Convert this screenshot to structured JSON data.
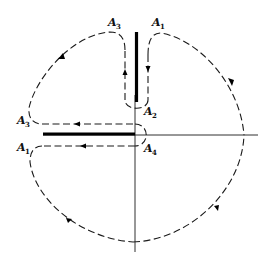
{
  "diagram": {
    "type": "complex-plane contour with branch cuts",
    "axes": {
      "origin": [
        135,
        135
      ],
      "horizontal": {
        "x1": 43,
        "x2": 258,
        "y": 135
      },
      "vertical": {
        "x": 135,
        "y1": 95,
        "y2": 252
      }
    },
    "branch_cuts": [
      {
        "name": "vertical-cut",
        "from": "origin",
        "direction": "up"
      },
      {
        "name": "horizontal-cut",
        "from": "origin",
        "direction": "left"
      }
    ],
    "labels": [
      {
        "id": "A3-top",
        "base": "A",
        "sub": "3",
        "x": 108,
        "y": 26
      },
      {
        "id": "A1-top",
        "base": "A",
        "sub": "1",
        "x": 152,
        "y": 26
      },
      {
        "id": "A2",
        "base": "A",
        "sub": "2",
        "x": 144,
        "y": 115
      },
      {
        "id": "A3-left",
        "base": "A",
        "sub": "3",
        "x": 17,
        "y": 124
      },
      {
        "id": "A1-left",
        "base": "A",
        "sub": "1",
        "x": 17,
        "y": 151
      },
      {
        "id": "A4",
        "base": "A",
        "sub": "4",
        "x": 144,
        "y": 152
      }
    ],
    "arrows": [
      {
        "segment": "upper-right-arc",
        "direction": "clockwise"
      },
      {
        "segment": "right-side-of-vertical-cut",
        "direction": "down"
      },
      {
        "segment": "left-side-of-vertical-cut",
        "direction": "up"
      },
      {
        "segment": "upper-left-arc",
        "direction": "counter-clockwise"
      },
      {
        "segment": "upper-side-of-horizontal-cut",
        "direction": "left"
      },
      {
        "segment": "lower-side-of-horizontal-cut",
        "direction": "left"
      },
      {
        "segment": "lower-left-arc",
        "direction": "counter-clockwise"
      },
      {
        "segment": "lower-right-arc",
        "direction": "counter-clockwise"
      }
    ]
  }
}
